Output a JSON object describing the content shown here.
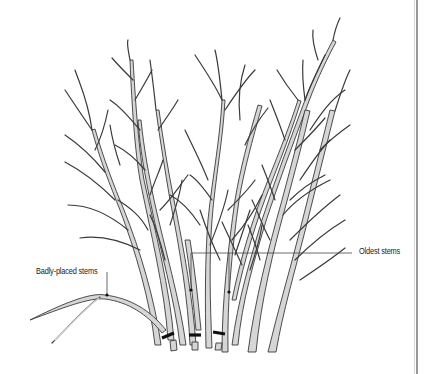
{
  "diagram": {
    "labels": {
      "badly_placed": "Badly-placed stems",
      "oldest": "Oldest stems"
    },
    "cut_marks": 3,
    "colors": {
      "stem_fill": "#d6d6d6",
      "stem_outline": "#3a3a3a",
      "cut_mark": "#111111",
      "border": "#9a9a9a",
      "background": "#ffffff"
    }
  }
}
